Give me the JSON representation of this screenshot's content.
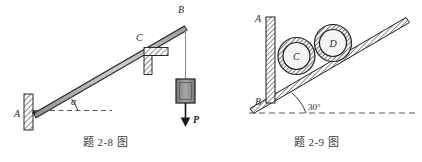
{
  "sheet": {
    "title": "Mechanics textbook figure pair",
    "background_color": "#ffffff",
    "ink_color": "#2b2b2b"
  },
  "figures": [
    {
      "id": "fig-2-8",
      "caption": "题 2-8 图",
      "description": "Inclined rod AB pinned to a vertical wall at A, resting on a bracket support at C, carrying a hanging block of weight P at end B.",
      "labels": {
        "point_a": "A",
        "point_b": "B",
        "point_c": "C",
        "angle": "α",
        "load": "P"
      },
      "colors": {
        "beam_fill": "#b9b9b9",
        "beam_stroke": "#2b2b2b",
        "hatch": "#6e6e6e",
        "block_fill": "#8c8c8c",
        "block_stroke": "#2b2b2b",
        "dashed": "#555555"
      }
    },
    {
      "id": "fig-2-9",
      "caption": "题 2-9 图",
      "description": "Two identical cylinders C and D resting on a 30-degree incline and retained by a vertical wall AB.",
      "labels": {
        "wall_top": "A",
        "wall_bottom": "B",
        "cylinder_lower": "C",
        "cylinder_upper": "D",
        "incline_angle": "30°"
      },
      "colors": {
        "hatch": "#6e6e6e",
        "ring_fill": "#9a9a9a",
        "disc_fill": "#f2f2f2",
        "stroke": "#1f1f1f",
        "dashed": "#555555"
      }
    }
  ]
}
